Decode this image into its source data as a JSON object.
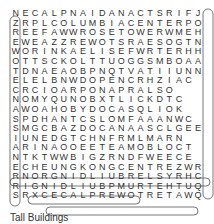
{
  "puzzle": {
    "title": "Tall Buildings",
    "rows": [
      "NECALPNAIDANACTSRIFJ",
      "ZRPLCOLUMBIACENTERPO",
      "REEFAWWROSETOWERWMEH",
      "EWEAZZREWOTSRAESOGTN",
      "WORINKAELISEFWRTERHH",
      "OTTSCKOLTTUOGGSMBOAA",
      "TDNAEAOBPNQTVATIIUNN",
      "ELELBNWDOPENCRHZIAC",
      "CRCIOARPONAPRALSO",
      "NOMYQUNOBXTLICKDTC",
      "AWOAHOBYDOCASQLIOK",
      "SPDHANTCSLOMFAAANWC",
      "SMGCBAZDOCANAASCLGEE",
      "IUNEDGTCHNFRMLMARN",
      "ARINAOOEETEAMOBLOCT",
      "NTKTWWBIGZRNDFWEECE",
      "ECHEUNGKONGCENTREZWR",
      "RNORGNIDLIUBRELSYRHC",
      "RIGNIDLIUBPMURTEHTUQ",
      "SRXCECALPREWOTRETAWQ"
    ]
  }
}
